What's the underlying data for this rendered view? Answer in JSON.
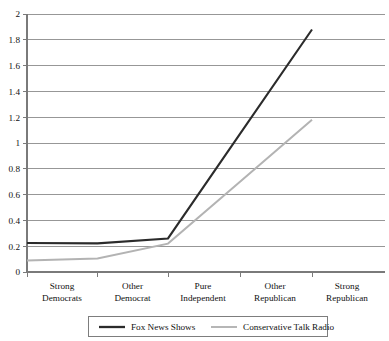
{
  "figure": {
    "top_clipped_text": "",
    "background_color": "#ffffff"
  },
  "chart_data": {
    "type": "line",
    "title": "",
    "subtitle": "",
    "xlabel": "",
    "ylabel": "",
    "categories": [
      "Strong Democrats",
      "Other Democrat",
      "Pure Independent",
      "Other Republican",
      "Strong Republican"
    ],
    "category_lines": [
      [
        "Strong",
        "Democrats"
      ],
      [
        "Other",
        "Democrat"
      ],
      [
        "Pure",
        "Independent"
      ],
      [
        "Other",
        "Republican"
      ],
      [
        "Strong",
        "Republican"
      ]
    ],
    "series": [
      {
        "name": "Fox News Shows",
        "color": "#2b2b2b",
        "stroke_width": 2.1,
        "values": [
          0.225,
          0.222,
          0.26,
          1.07,
          1.88
        ]
      },
      {
        "name": "Conservative Talk Radio",
        "color": "#b3b3b3",
        "stroke_width": 2.0,
        "values": [
          0.09,
          0.105,
          0.22,
          0.7,
          1.18
        ]
      }
    ],
    "ylim": [
      0,
      2
    ],
    "yticks": [
      0,
      0.2,
      0.4,
      0.6,
      0.8,
      1,
      1.2,
      1.4,
      1.6,
      1.8,
      2
    ],
    "ytick_labels": [
      "0",
      "0.2",
      "0.4",
      "0.6",
      "0.8",
      "1",
      "1.2",
      "1.4",
      "1.6",
      "1.8",
      "2"
    ],
    "grid": true,
    "grid_axis": "y",
    "legend_position": "bottom",
    "legend": [
      {
        "label": "Fox News Shows",
        "color": "#2b2b2b",
        "stroke_width": 2.3
      },
      {
        "label": "Conservative Talk Radio",
        "color": "#b3b3b3",
        "stroke_width": 1.9
      }
    ]
  }
}
